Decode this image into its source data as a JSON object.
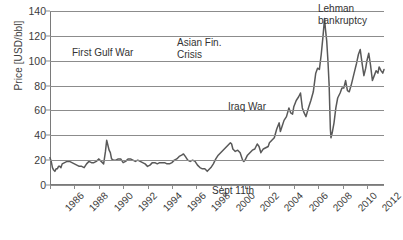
{
  "axes": {
    "ylabel": "Price [USD/bbl]",
    "yticks": [
      "0",
      "20",
      "40",
      "60",
      "80",
      "100",
      "120",
      "140"
    ],
    "xticks": [
      "1986",
      "1988",
      "1990",
      "1992",
      "1994",
      "1996",
      "1998",
      "2000",
      "2002",
      "2004",
      "2006",
      "2008",
      "2010",
      "2012"
    ],
    "ymin": 0,
    "ymax": 140,
    "xmin": 1986,
    "xmax": 2013.4
  },
  "annotations": [
    {
      "name": "first-gulf-war",
      "lines": [
        "First Gulf War"
      ],
      "x": 72,
      "y": 47
    },
    {
      "name": "asian-financial-crisis",
      "lines": [
        "Asian Fin.",
        "Crisis"
      ],
      "x": 177,
      "y": 37
    },
    {
      "name": "sept-11th",
      "lines": [
        "Sept 11th"
      ],
      "x": 212,
      "y": 185
    },
    {
      "name": "iraq-war",
      "lines": [
        "Iraq War"
      ],
      "x": 228,
      "y": 101
    },
    {
      "name": "lehman-bankruptcy",
      "lines": [
        "Lehman",
        "bankruptcy"
      ],
      "x": 318,
      "y": 3
    }
  ],
  "chart_data": {
    "type": "line",
    "title": "",
    "xlabel": "",
    "ylabel": "Price [USD/bbl]",
    "xlim": [
      1986,
      2013.4
    ],
    "ylim": [
      0,
      140
    ],
    "grid": true,
    "legend": false,
    "line_color": "#595959",
    "series": [
      {
        "name": "Crude oil price",
        "x": [
          1986.0,
          1986.1,
          1986.2,
          1986.3,
          1986.4,
          1986.5,
          1986.6,
          1986.7,
          1986.8,
          1986.9,
          1987.0,
          1987.2,
          1987.4,
          1987.6,
          1987.8,
          1988.0,
          1988.2,
          1988.4,
          1988.6,
          1988.8,
          1989.0,
          1989.2,
          1989.4,
          1989.6,
          1989.8,
          1990.0,
          1990.2,
          1990.4,
          1990.55,
          1990.65,
          1990.75,
          1990.85,
          1990.95,
          1991.05,
          1991.2,
          1991.4,
          1991.6,
          1991.8,
          1992.0,
          1992.2,
          1992.4,
          1992.6,
          1992.8,
          1993.0,
          1993.2,
          1993.4,
          1993.6,
          1993.8,
          1994.0,
          1994.2,
          1994.4,
          1994.6,
          1994.8,
          1995.0,
          1995.2,
          1995.4,
          1995.6,
          1995.8,
          1996.0,
          1996.2,
          1996.4,
          1996.6,
          1996.8,
          1996.95,
          1997.1,
          1997.3,
          1997.5,
          1997.7,
          1997.9,
          1998.1,
          1998.3,
          1998.5,
          1998.7,
          1998.9,
          1999.0,
          1999.2,
          1999.4,
          1999.6,
          1999.8,
          2000.0,
          2000.2,
          2000.4,
          2000.6,
          2000.8,
          2000.9,
          2001.0,
          2001.2,
          2001.4,
          2001.6,
          2001.8,
          2001.9,
          2002.0,
          2002.2,
          2002.4,
          2002.6,
          2002.8,
          2003.0,
          2003.15,
          2003.3,
          2003.5,
          2003.7,
          2003.9,
          2004.0,
          2004.2,
          2004.4,
          2004.6,
          2004.8,
          2004.9,
          2005.0,
          2005.2,
          2005.4,
          2005.6,
          2005.75,
          2005.9,
          2006.0,
          2006.2,
          2006.4,
          2006.55,
          2006.7,
          2006.85,
          2007.0,
          2007.2,
          2007.4,
          2007.6,
          2007.8,
          2007.95,
          2008.1,
          2008.25,
          2008.4,
          2008.52,
          2008.6,
          2008.7,
          2008.8,
          2008.9,
          2009.0,
          2009.05,
          2009.15,
          2009.3,
          2009.45,
          2009.6,
          2009.8,
          2009.95,
          2010.1,
          2010.25,
          2010.4,
          2010.55,
          2010.7,
          2010.85,
          2011.0,
          2011.15,
          2011.3,
          2011.45,
          2011.6,
          2011.75,
          2011.9,
          2012.0,
          2012.15,
          2012.3,
          2012.45,
          2012.6,
          2012.75,
          2012.9,
          2013.0,
          2013.15,
          2013.3,
          2013.4
        ],
        "values": [
          22,
          19,
          14,
          12,
          11,
          13,
          13,
          15,
          15,
          14,
          17,
          18,
          19,
          19,
          18,
          17,
          16,
          15,
          15,
          14,
          17,
          19,
          18,
          18,
          19,
          21,
          19,
          17,
          27,
          36,
          32,
          28,
          26,
          21,
          20,
          20,
          21,
          21,
          18,
          19,
          21,
          21,
          20,
          19,
          20,
          19,
          18,
          17,
          15,
          16,
          18,
          18,
          17,
          18,
          18,
          18,
          17,
          17,
          18,
          20,
          21,
          23,
          24,
          25,
          23,
          20,
          19,
          20,
          19,
          16,
          14,
          13,
          13,
          11,
          12,
          14,
          17,
          21,
          24,
          26,
          28,
          30,
          32,
          34,
          33,
          29,
          27,
          28,
          26,
          20,
          19,
          20,
          24,
          26,
          28,
          29,
          33,
          31,
          26,
          29,
          30,
          31,
          34,
          36,
          38,
          45,
          50,
          43,
          46,
          52,
          55,
          62,
          58,
          57,
          63,
          68,
          71,
          74,
          62,
          58,
          55,
          62,
          68,
          75,
          90,
          94,
          93,
          105,
          120,
          134,
          125,
          116,
          100,
          80,
          45,
          38,
          42,
          50,
          62,
          70,
          74,
          78,
          78,
          84,
          76,
          75,
          80,
          86,
          92,
          98,
          105,
          109,
          98,
          88,
          94,
          100,
          106,
          96,
          84,
          88,
          92,
          90,
          95,
          92,
          90,
          93
        ]
      }
    ]
  }
}
